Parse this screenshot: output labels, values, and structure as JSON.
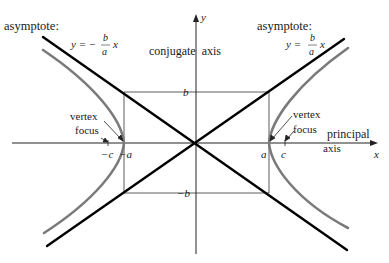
{
  "diagram": {
    "colors": {
      "asymptote": "#000000",
      "hyperbola": "#7a7a7a",
      "axes": "#222222",
      "box": "#333333",
      "text": "#1a1a1a"
    },
    "labels": {
      "asymptote_left": "asymptote:",
      "asymptote_left_eq_lhs": "y = −",
      "asymptote_left_num": "b",
      "asymptote_left_den": "a",
      "asymptote_left_x": "x",
      "asymptote_right": "asymptote:",
      "asymptote_right_eq_lhs": "y =",
      "asymptote_right_num": "b",
      "asymptote_right_den": "a",
      "asymptote_right_x": "x",
      "conjugate_axis": "conjugate  axis",
      "principal": "principal",
      "axis": "axis",
      "x_axis": "x",
      "y_axis": "y",
      "b": "b",
      "neg_b": "−b",
      "a": "a",
      "neg_a": "−a",
      "c": "c",
      "neg_c": "−c",
      "vertex_left": "vertex",
      "focus_left": "focus",
      "vertex_right": "vertex",
      "focus_right": "focus"
    }
  }
}
